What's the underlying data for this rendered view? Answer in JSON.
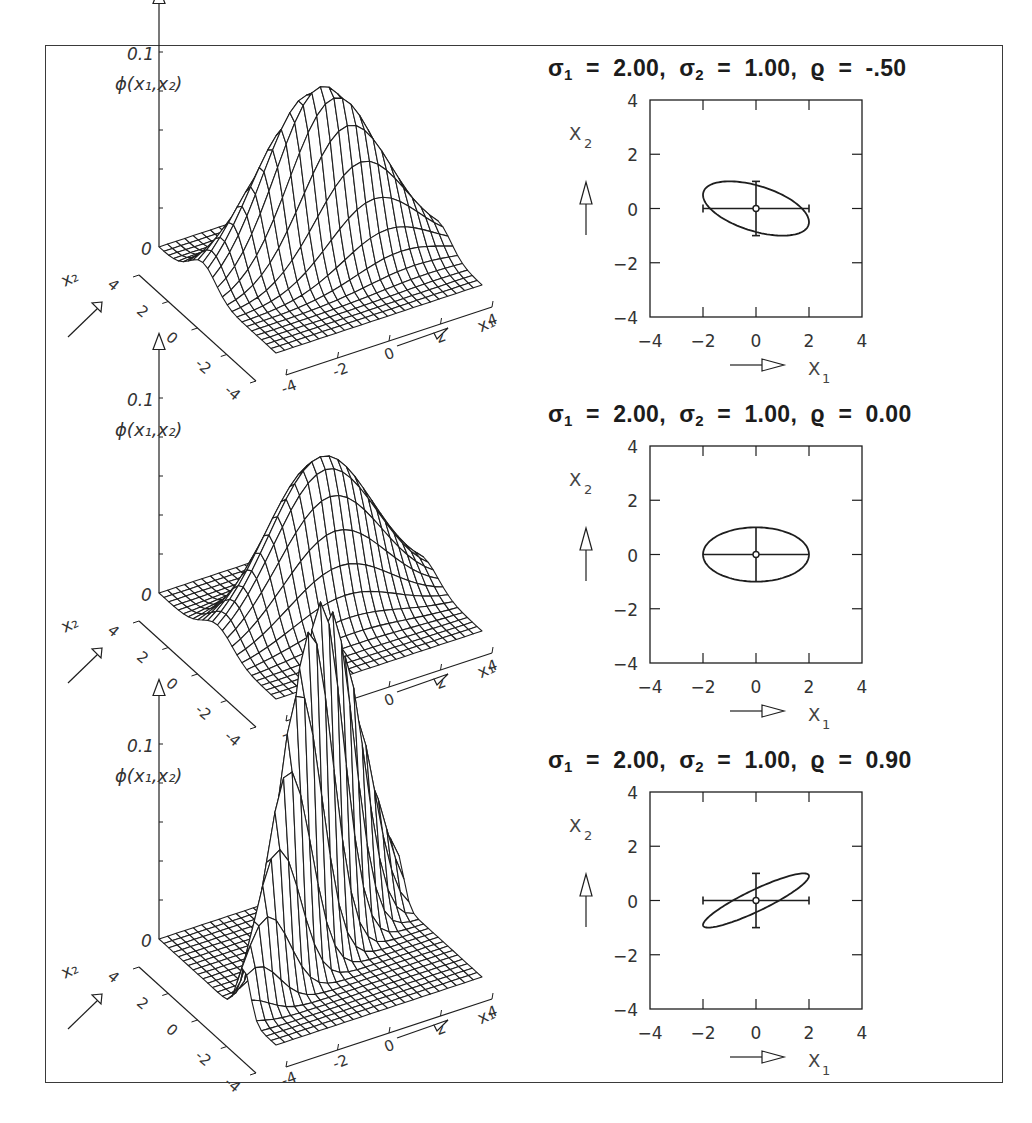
{
  "figure": {
    "panels": [
      {
        "title": {
          "s1_label": "σ",
          "s1_sub": "1",
          "s1_val": "2.00",
          "s2_label": "σ",
          "s2_sub": "2",
          "s2_val": "1.00",
          "rho_label": "ϱ",
          "rho_val": "-.50"
        }
      },
      {
        "title": {
          "s1_label": "σ",
          "s1_sub": "1",
          "s1_val": "2.00",
          "s2_label": "σ",
          "s2_sub": "2",
          "s2_val": "1.00",
          "rho_label": "ϱ",
          "rho_val": "0.00"
        }
      },
      {
        "title": {
          "s1_label": "σ",
          "s1_sub": "1",
          "s1_val": "2.00",
          "s2_label": "σ",
          "s2_sub": "2",
          "s2_val": "1.00",
          "rho_label": "ϱ",
          "rho_val": "0.90"
        }
      }
    ],
    "surface_axis_labels": {
      "z": "ϕ(x₁,x₂)",
      "z_tick_max": "0.1",
      "z_tick_zero": "0",
      "x1": "x₁",
      "x2": "x₂"
    },
    "surface_ticks": [
      "-4",
      "-2",
      "0",
      "2",
      "4"
    ],
    "contour_ticks": [
      "-4",
      "-2",
      "0",
      "2",
      "4"
    ],
    "contour_axis_labels": {
      "x1": "X",
      "x1_sub": "1",
      "x2": "X",
      "x2_sub": "2"
    }
  },
  "chart_data": [
    {
      "type": "surface",
      "title": "σ1 = 2.00, σ2 = 1.00, ϱ = -.50",
      "function": "bivariate normal density ϕ(x1,x2)",
      "params": {
        "sigma1": 2.0,
        "sigma2": 1.0,
        "rho": -0.5,
        "mu1": 0,
        "mu2": 0
      },
      "xlabel": "x1",
      "ylabel": "x2",
      "zlabel": "ϕ(x1,x2)",
      "xlim": [
        -4,
        4
      ],
      "ylim": [
        -4,
        4
      ],
      "zlim": [
        0,
        0.1
      ],
      "ticks": [
        -4,
        -2,
        0,
        2,
        4
      ],
      "z_ticks": [
        0,
        0.1
      ]
    },
    {
      "type": "contour",
      "title": "σ1 = 2.00, σ2 = 1.00, ϱ = -.50",
      "description": "covariance ellipse with ±σ error crosses at origin",
      "params": {
        "sigma1": 2.0,
        "sigma2": 1.0,
        "rho": -0.5
      },
      "xlabel": "x1",
      "ylabel": "x2",
      "xlim": [
        -4,
        4
      ],
      "ylim": [
        -4,
        4
      ],
      "ticks": [
        -4,
        -2,
        0,
        2,
        4
      ],
      "error_bars": {
        "x": [
          -2,
          2
        ],
        "y": [
          -1,
          1
        ],
        "center": [
          0,
          0
        ]
      }
    },
    {
      "type": "surface",
      "title": "σ1 = 2.00, σ2 = 1.00, ϱ = 0.00",
      "function": "bivariate normal density ϕ(x1,x2)",
      "params": {
        "sigma1": 2.0,
        "sigma2": 1.0,
        "rho": 0.0,
        "mu1": 0,
        "mu2": 0
      },
      "xlabel": "x1",
      "ylabel": "x2",
      "zlabel": "ϕ(x1,x2)",
      "xlim": [
        -4,
        4
      ],
      "ylim": [
        -4,
        4
      ],
      "zlim": [
        0,
        0.1
      ],
      "ticks": [
        -4,
        -2,
        0,
        2,
        4
      ],
      "z_ticks": [
        0,
        0.1
      ]
    },
    {
      "type": "contour",
      "title": "σ1 = 2.00, σ2 = 1.00, ϱ = 0.00",
      "description": "covariance ellipse with ±σ error crosses at origin",
      "params": {
        "sigma1": 2.0,
        "sigma2": 1.0,
        "rho": 0.0
      },
      "xlabel": "x1",
      "ylabel": "x2",
      "xlim": [
        -4,
        4
      ],
      "ylim": [
        -4,
        4
      ],
      "ticks": [
        -4,
        -2,
        0,
        2,
        4
      ],
      "error_bars": {
        "x": [
          -2,
          2
        ],
        "y": [
          -1,
          1
        ],
        "center": [
          0,
          0
        ]
      }
    },
    {
      "type": "surface",
      "title": "σ1 = 2.00, σ2 = 1.00, ϱ = 0.90",
      "function": "bivariate normal density ϕ(x1,x2)",
      "params": {
        "sigma1": 2.0,
        "sigma2": 1.0,
        "rho": 0.9,
        "mu1": 0,
        "mu2": 0
      },
      "xlabel": "x1",
      "ylabel": "x2",
      "zlabel": "ϕ(x1,x2)",
      "xlim": [
        -4,
        4
      ],
      "ylim": [
        -4,
        4
      ],
      "zlim": [
        0,
        0.1
      ],
      "ticks": [
        -4,
        -2,
        0,
        2,
        4
      ],
      "z_ticks": [
        0,
        0.1
      ]
    },
    {
      "type": "contour",
      "title": "σ1 = 2.00, σ2 = 1.00, ϱ = 0.90",
      "description": "covariance ellipse with ±σ error crosses at origin",
      "params": {
        "sigma1": 2.0,
        "sigma2": 1.0,
        "rho": 0.9
      },
      "xlabel": "x1",
      "ylabel": "x2",
      "xlim": [
        -4,
        4
      ],
      "ylim": [
        -4,
        4
      ],
      "ticks": [
        -4,
        -2,
        0,
        2,
        4
      ],
      "error_bars": {
        "x": [
          -2,
          2
        ],
        "y": [
          -1,
          1
        ],
        "center": [
          0,
          0
        ]
      }
    }
  ]
}
